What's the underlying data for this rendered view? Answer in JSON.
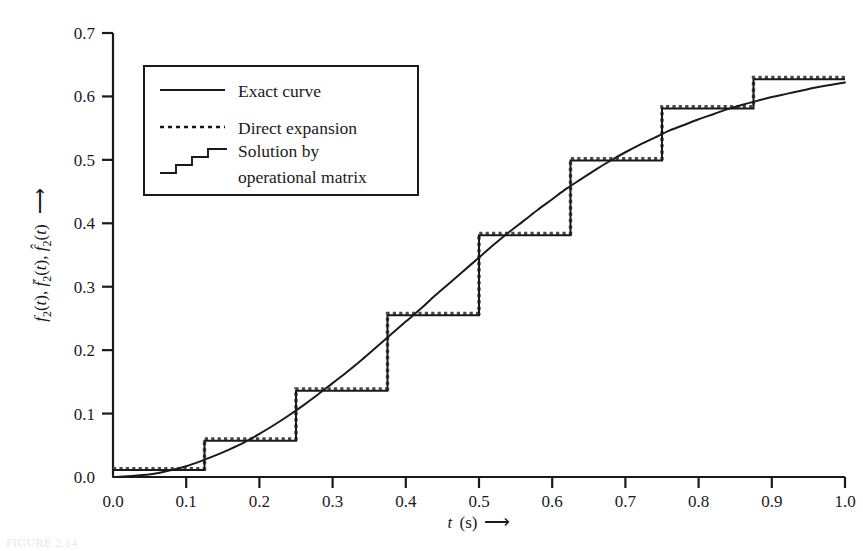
{
  "chart_data": {
    "type": "line",
    "title": "",
    "xlabel": "t (s)",
    "ylabel": "f_2(t), f̅2(t), f̂2(t)",
    "xlabel_arrow": "⟶",
    "ylabel_arrow": "⟶",
    "xlim": [
      0.0,
      1.0
    ],
    "ylim": [
      0.0,
      0.7
    ],
    "xticks": [
      0.0,
      0.1,
      0.2,
      0.3,
      0.4,
      0.5,
      0.6,
      0.7,
      0.8,
      0.9,
      1.0
    ],
    "xtick_labels": [
      "0.0",
      "0.1",
      "0.2",
      "0.3",
      "0.4",
      "0.5",
      "0.6",
      "0.7",
      "0.8",
      "0.9",
      "1.0"
    ],
    "yticks": [
      0.0,
      0.1,
      0.2,
      0.3,
      0.4,
      0.5,
      0.6,
      0.7
    ],
    "ytick_labels": [
      "0.0",
      "0.1",
      "0.2",
      "0.3",
      "0.4",
      "0.5",
      "0.6",
      "0.7"
    ],
    "grid": false,
    "legend_position": "upper-left-inside",
    "series": [
      {
        "name": "Exact curve",
        "style": "solid",
        "color": "#1a1a1a",
        "x": [
          0.0,
          0.02,
          0.04,
          0.06,
          0.08,
          0.1,
          0.12,
          0.14,
          0.16,
          0.18,
          0.2,
          0.22,
          0.24,
          0.26,
          0.28,
          0.3,
          0.32,
          0.34,
          0.36,
          0.38,
          0.4,
          0.42,
          0.44,
          0.46,
          0.48,
          0.5,
          0.52,
          0.54,
          0.56,
          0.58,
          0.6,
          0.62,
          0.64,
          0.66,
          0.68,
          0.7,
          0.72,
          0.74,
          0.76,
          0.78,
          0.8,
          0.82,
          0.84,
          0.86,
          0.88,
          0.9,
          0.92,
          0.94,
          0.96,
          0.98,
          1.0
        ],
        "y": [
          0.0,
          0.001,
          0.003,
          0.006,
          0.011,
          0.017,
          0.025,
          0.034,
          0.044,
          0.055,
          0.068,
          0.082,
          0.097,
          0.113,
          0.13,
          0.148,
          0.166,
          0.185,
          0.205,
          0.225,
          0.245,
          0.265,
          0.286,
          0.306,
          0.326,
          0.346,
          0.366,
          0.385,
          0.403,
          0.421,
          0.438,
          0.455,
          0.47,
          0.485,
          0.499,
          0.512,
          0.524,
          0.535,
          0.546,
          0.555,
          0.564,
          0.572,
          0.58,
          0.587,
          0.593,
          0.599,
          0.604,
          0.609,
          0.614,
          0.618,
          0.622
        ]
      },
      {
        "name": "Direct expansion",
        "style": "dotted",
        "color": "#4a4a4a",
        "step_edges": [
          0.0,
          0.125,
          0.25,
          0.375,
          0.5,
          0.625,
          0.75,
          0.875,
          1.0
        ],
        "step_values": [
          0.013,
          0.06,
          0.139,
          0.258,
          0.384,
          0.502,
          0.584,
          0.63
        ]
      },
      {
        "name": "Solution by operational matrix",
        "style": "step-solid",
        "color": "#1a1a1a",
        "step_edges": [
          0.0,
          0.125,
          0.25,
          0.375,
          0.5,
          0.625,
          0.75,
          0.875,
          1.0
        ],
        "step_values": [
          0.011,
          0.057,
          0.136,
          0.255,
          0.381,
          0.499,
          0.581,
          0.627
        ]
      }
    ],
    "legend_entries": [
      {
        "label": "Exact curve",
        "style": "solid"
      },
      {
        "label": "Direct expansion",
        "style": "dotted"
      },
      {
        "label_line1": "Solution by",
        "label_line2": "operational matrix",
        "style": "step"
      }
    ]
  },
  "caption": {
    "text": "FIGURE 2.14"
  }
}
